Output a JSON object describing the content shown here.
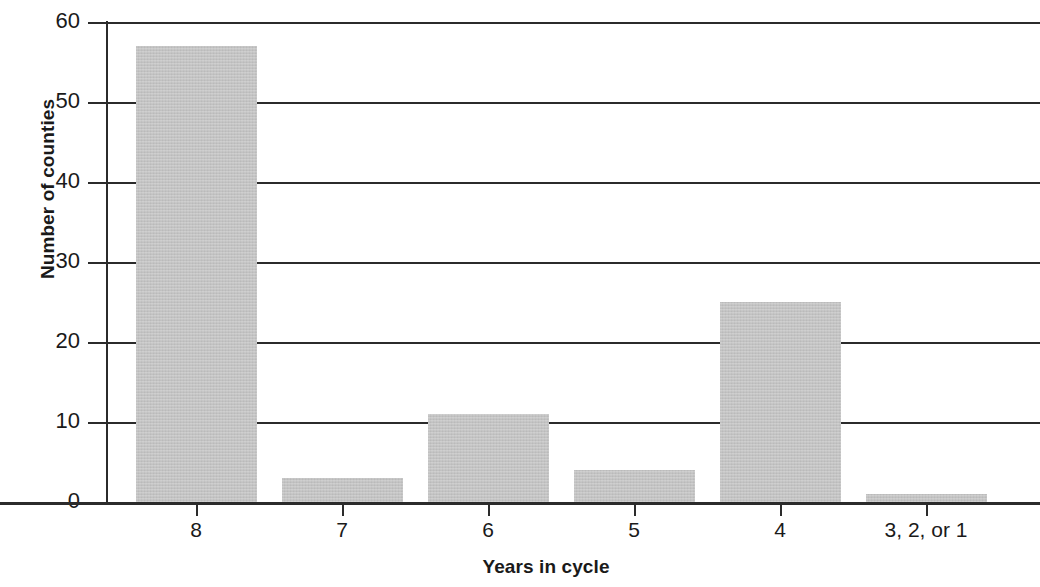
{
  "chart_data": {
    "type": "bar",
    "title": "",
    "subtitle": "",
    "xlabel": "Years in cycle",
    "ylabel": "Number of counties",
    "categories": [
      "8",
      "7",
      "6",
      "5",
      "4",
      "3, 2, or 1"
    ],
    "values": [
      57,
      3,
      11,
      4,
      25,
      1
    ],
    "series": [
      {
        "name": "Number of counties",
        "values": [
          57,
          3,
          11,
          4,
          25,
          1
        ]
      }
    ],
    "ylim": [
      0,
      60
    ],
    "ytick_labels": [
      "60",
      "50",
      "40",
      "30",
      "20",
      "10",
      "0"
    ],
    "ytick_values": [
      60,
      50,
      40,
      30,
      20,
      10,
      0
    ],
    "grid": "horizontal",
    "legend": "none",
    "annotations": [],
    "colors": {
      "bar_fill": "#c3c3c3",
      "axis": "#2b2b2b",
      "gridline": "#2b2b2b",
      "text": "#1a1a1a",
      "background": "#ffffff"
    }
  }
}
